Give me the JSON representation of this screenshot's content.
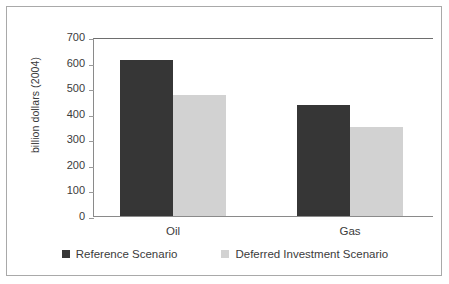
{
  "chart_data": {
    "type": "bar",
    "title": "",
    "xlabel": "",
    "ylabel": "billion dollars (2004)",
    "categories": [
      "Oil",
      "Gas"
    ],
    "series": [
      {
        "name": "Reference Scenario",
        "color": "#363636",
        "values": [
          610,
          435
        ]
      },
      {
        "name": "Deferred Investment Scenario",
        "color": "#d2d2d2",
        "values": [
          475,
          350
        ]
      }
    ],
    "ylim": [
      0,
      700
    ],
    "yticks": [
      0,
      100,
      200,
      300,
      400,
      500,
      600,
      700
    ],
    "ytick_labels": [
      "0",
      "100",
      "200",
      "300",
      "400",
      "500",
      "600",
      "700"
    ],
    "grid": false,
    "legend_position": "bottom"
  },
  "axis": {
    "y_title": "billion dollars (2004)",
    "ticks": [
      {
        "label": "700",
        "value": 700
      },
      {
        "label": "600",
        "value": 600
      },
      {
        "label": "500",
        "value": 500
      },
      {
        "label": "400",
        "value": 400
      },
      {
        "label": "300",
        "value": 300
      },
      {
        "label": "200",
        "value": 200
      },
      {
        "label": "100",
        "value": 100
      },
      {
        "label": "0",
        "value": 0
      }
    ],
    "categories": [
      {
        "label": "Oil"
      },
      {
        "label": "Gas"
      }
    ]
  },
  "legend": {
    "entries": [
      {
        "label": "Reference Scenario",
        "color": "#363636"
      },
      {
        "label": "Deferred Investment Scenario",
        "color": "#d2d2d2"
      }
    ]
  }
}
